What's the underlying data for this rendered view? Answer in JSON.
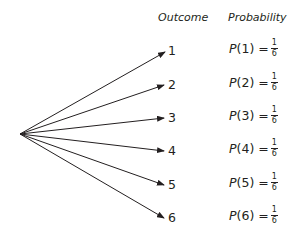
{
  "headers": {
    "outcome": "Outcome",
    "probability": "Probability"
  },
  "outcomes": [
    {
      "label": "1",
      "p": "P",
      "arg": "(1) =",
      "num": "1",
      "den": "6"
    },
    {
      "label": "2",
      "p": "P",
      "arg": "(2) =",
      "num": "1",
      "den": "6"
    },
    {
      "label": "3",
      "p": "P",
      "arg": "(3) =",
      "num": "1",
      "den": "6"
    },
    {
      "label": "4",
      "p": "P",
      "arg": "(4) =",
      "num": "1",
      "den": "6"
    },
    {
      "label": "5",
      "p": "P",
      "arg": "(5) =",
      "num": "1",
      "den": "6"
    },
    {
      "label": "6",
      "p": "P",
      "arg": "(6) =",
      "num": "1",
      "den": "6"
    }
  ],
  "colors": {
    "line": "#231f20"
  }
}
